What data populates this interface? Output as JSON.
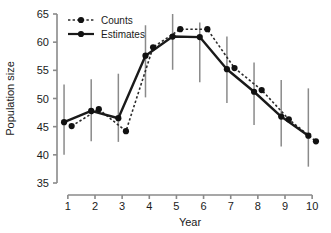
{
  "chart_data": {
    "type": "line",
    "title": "",
    "xlabel": "Year",
    "ylabel": "Population size",
    "x": [
      1,
      2,
      3,
      4,
      5,
      6,
      7,
      8,
      9,
      10
    ],
    "xtick_labels": [
      "1",
      "2",
      "3",
      "4",
      "5",
      "6",
      "7",
      "8",
      "9",
      "10"
    ],
    "ytick_labels": [
      "35",
      "40",
      "45",
      "50",
      "55",
      "60",
      "65"
    ],
    "yticks": [
      35,
      40,
      45,
      50,
      55,
      60,
      65
    ],
    "xlim": [
      0.6,
      10.4
    ],
    "ylim": [
      35,
      65
    ],
    "grid": false,
    "legend_position": "top-left",
    "series": [
      {
        "name": "Counts",
        "style": "dotted",
        "marker": "filled-circle",
        "x_offset": 0.14,
        "values": [
          45.1,
          48.1,
          44.2,
          59.1,
          62.3,
          62.3,
          55.4,
          51.5,
          46.3,
          42.4
        ]
      },
      {
        "name": "Estimates",
        "style": "solid",
        "marker": "filled-circle",
        "x_offset": -0.14,
        "values": [
          45.8,
          47.8,
          46.5,
          57.6,
          61.0,
          60.9,
          55.2,
          51.2,
          46.8,
          43.4
        ],
        "error_bars": {
          "lower": [
            40.0,
            42.4,
            42.3,
            50.2,
            55.1,
            52.9,
            49.2,
            45.3,
            41.5,
            37.9
          ],
          "upper": [
            52.5,
            53.4,
            54.4,
            63.0,
            65.0,
            63.5,
            61.0,
            56.4,
            53.3,
            51.8
          ]
        }
      }
    ]
  },
  "legend": {
    "entries": [
      {
        "label": "Counts"
      },
      {
        "label": "Estimates"
      }
    ]
  },
  "colors": {
    "axis": "#8a8a8a",
    "error_bar": "#8a8a8a",
    "counts_line": "#2b2b2b",
    "estimates_line": "#1a1a1a",
    "marker": "#111111",
    "text": "#1a1a1a",
    "background": "#ffffff"
  }
}
